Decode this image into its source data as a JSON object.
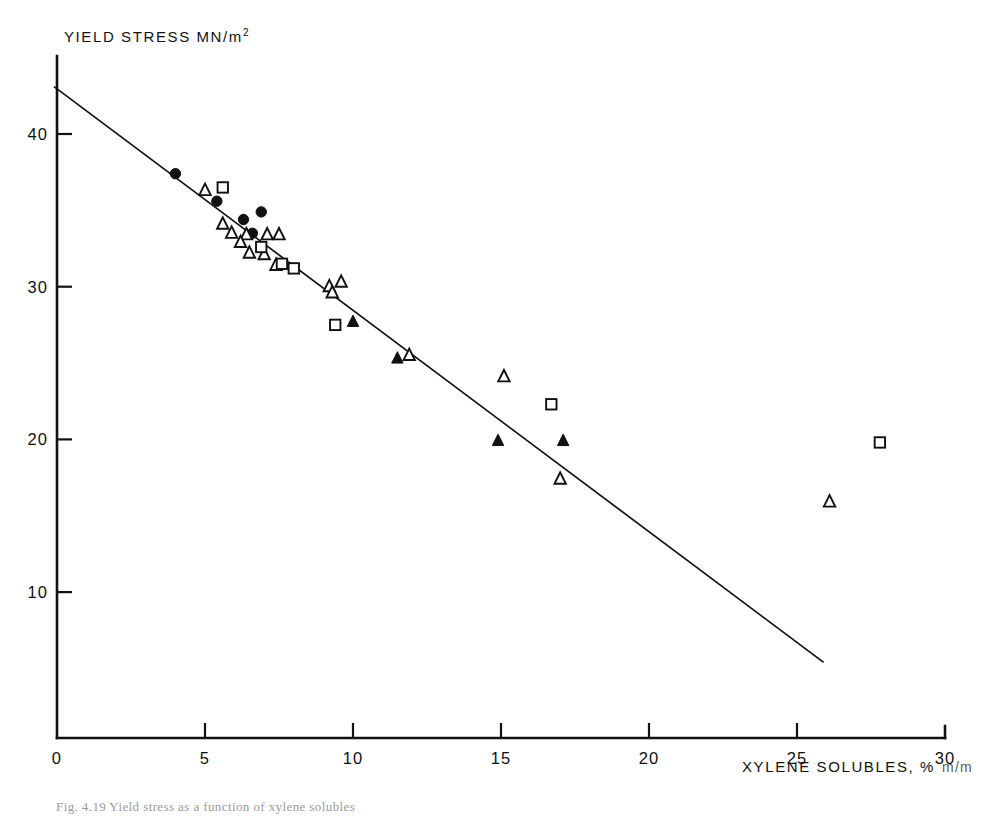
{
  "figure": {
    "caption": "Fig. 4.19  Yield stress as a function of xylene solubles"
  },
  "chart_data": {
    "type": "scatter",
    "title": "",
    "xlabel": "XYLENE SOLUBLES, % m/m",
    "ylabel": "YIELD STRESS MN/m2",
    "ylabel_main": "YIELD STRESS MN/",
    "ylabel_unit_base": "m",
    "ylabel_unit_exp": "2",
    "xlabel_main": "XYLENE SOLUBLES, %",
    "xlabel_sub": "m/m",
    "xlim": [
      0,
      30
    ],
    "ylim": [
      0,
      44
    ],
    "grid": false,
    "legend": "none",
    "xticks": [
      0,
      5,
      10,
      15,
      20,
      25,
      30
    ],
    "xticklabels": [
      "0",
      "5",
      "10",
      "15",
      "20",
      "25",
      "30"
    ],
    "yticks": [
      10,
      20,
      30,
      40
    ],
    "yticklabels": [
      "10",
      "20",
      "30",
      "40"
    ],
    "trendline": {
      "name": "linear fit",
      "x": [
        -0.1,
        25.9
      ],
      "y": [
        43.1,
        5.4
      ],
      "slope": -1.45,
      "intercept": 43.0
    },
    "series": [
      {
        "name": "filled-circle",
        "marker": "filled circle",
        "color": "#111111",
        "points": [
          {
            "x": 4.0,
            "y": 37.4
          },
          {
            "x": 5.4,
            "y": 35.6
          },
          {
            "x": 6.3,
            "y": 34.4
          },
          {
            "x": 6.9,
            "y": 34.9
          },
          {
            "x": 6.6,
            "y": 33.5
          }
        ]
      },
      {
        "name": "open-triangle",
        "marker": "open triangle",
        "color": "#111111",
        "points": [
          {
            "x": 5.0,
            "y": 36.3
          },
          {
            "x": 5.6,
            "y": 34.1
          },
          {
            "x": 5.9,
            "y": 33.5
          },
          {
            "x": 6.4,
            "y": 33.4
          },
          {
            "x": 6.2,
            "y": 32.9
          },
          {
            "x": 6.5,
            "y": 32.2
          },
          {
            "x": 7.1,
            "y": 33.4
          },
          {
            "x": 7.5,
            "y": 33.4
          },
          {
            "x": 7.0,
            "y": 32.1
          },
          {
            "x": 7.4,
            "y": 31.4
          },
          {
            "x": 9.2,
            "y": 30.0
          },
          {
            "x": 9.6,
            "y": 30.3
          },
          {
            "x": 9.3,
            "y": 29.6
          },
          {
            "x": 11.9,
            "y": 25.5
          },
          {
            "x": 15.1,
            "y": 24.1
          },
          {
            "x": 17.0,
            "y": 17.4
          },
          {
            "x": 26.1,
            "y": 15.9
          }
        ]
      },
      {
        "name": "filled-triangle",
        "marker": "filled triangle",
        "color": "#111111",
        "points": [
          {
            "x": 10.0,
            "y": 27.7
          },
          {
            "x": 11.5,
            "y": 25.3
          },
          {
            "x": 14.9,
            "y": 19.9
          },
          {
            "x": 17.1,
            "y": 19.9
          }
        ]
      },
      {
        "name": "open-square",
        "marker": "open square",
        "color": "#111111",
        "points": [
          {
            "x": 5.6,
            "y": 36.5
          },
          {
            "x": 6.9,
            "y": 32.6
          },
          {
            "x": 7.6,
            "y": 31.5
          },
          {
            "x": 8.0,
            "y": 31.2
          },
          {
            "x": 9.4,
            "y": 27.5
          },
          {
            "x": 16.7,
            "y": 22.3
          },
          {
            "x": 27.8,
            "y": 19.8
          }
        ]
      }
    ]
  }
}
